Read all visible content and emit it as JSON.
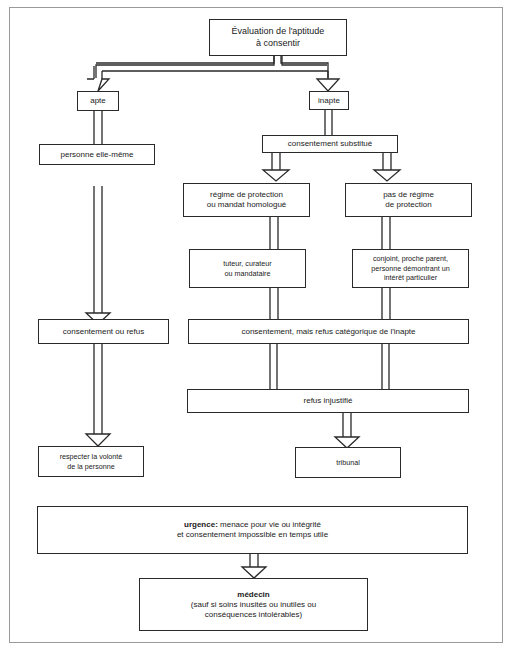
{
  "diagram": {
    "nodes": {
      "evaluation": {
        "lines": [
          "Évaluation de l'aptitude",
          "à consentir"
        ]
      },
      "apte": {
        "label": "apte"
      },
      "inapte": {
        "label": "inapte"
      },
      "personne_elle_meme": {
        "label": "personne elle-même"
      },
      "consentement_substitue": {
        "label": "consentement substitué"
      },
      "regime_protection": {
        "lines": [
          "régime de protection",
          "ou mandat homologué"
        ]
      },
      "pas_regime": {
        "lines": [
          "pas de régime",
          "de protection"
        ]
      },
      "tuteur": {
        "lines": [
          "tuteur, curateur",
          "ou mandataire"
        ]
      },
      "conjoint": {
        "lines": [
          "conjoint, proche parent,",
          "personne démontrant un",
          "intérêt particulier"
        ]
      },
      "consentement_ou_refus": {
        "label": "consentement ou refus"
      },
      "refus_categorique": {
        "label": "consentement, mais refus catégorique de l'inapte"
      },
      "refus_injustifie": {
        "label": "refus injustifié"
      },
      "respecter": {
        "lines": [
          "respecter la volonté",
          "de la personne"
        ]
      },
      "tribunal": {
        "label": "tribunal"
      },
      "urgence": {
        "bold": "urgence:",
        "rest": " menace pour vie ou intégrité",
        "line2": "et consentement impossible en temps utile"
      },
      "medecin": {
        "bold": "médecin",
        "lines": [
          "(sauf si soins inusités ou inutiles ou",
          "conséquences intolérables)"
        ]
      }
    },
    "edges": [
      {
        "from": "evaluation",
        "to": "apte",
        "style": "double-arrow"
      },
      {
        "from": "evaluation",
        "to": "inapte",
        "style": "double-arrow"
      },
      {
        "from": "apte",
        "to": "personne_elle_meme",
        "style": "double-line"
      },
      {
        "from": "personne_elle_meme",
        "to": "consentement_ou_refus",
        "style": "double-arrow"
      },
      {
        "from": "consentement_ou_refus",
        "to": "respecter",
        "style": "double-arrow"
      },
      {
        "from": "inapte",
        "to": "consentement_substitue",
        "style": "double-line"
      },
      {
        "from": "consentement_substitue",
        "to": "regime_protection",
        "style": "double-arrow"
      },
      {
        "from": "consentement_substitue",
        "to": "pas_regime",
        "style": "double-arrow"
      },
      {
        "from": "regime_protection",
        "to": "tuteur",
        "style": "double-line"
      },
      {
        "from": "pas_regime",
        "to": "conjoint",
        "style": "double-line"
      },
      {
        "from": "tuteur",
        "to": "refus_categorique",
        "style": "double-line"
      },
      {
        "from": "conjoint",
        "to": "refus_categorique",
        "style": "double-line"
      },
      {
        "from": "refus_categorique",
        "to": "refus_injustifie",
        "style": "double-line"
      },
      {
        "from": "refus_injustifie",
        "to": "tribunal",
        "style": "double-arrow"
      },
      {
        "from": "urgence",
        "to": "medecin",
        "style": "double-arrow"
      }
    ]
  }
}
